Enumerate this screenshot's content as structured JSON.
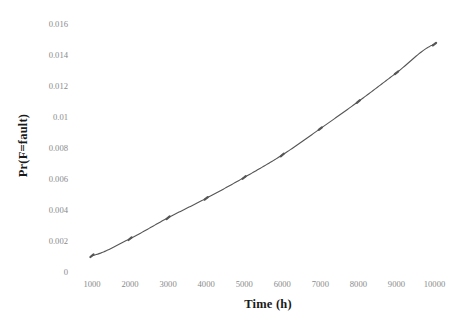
{
  "chart_data": {
    "type": "line",
    "title": "",
    "xlabel": "Time (h)",
    "ylabel": "Pr(F=fault)",
    "xlim": [
      1000,
      10000
    ],
    "ylim": [
      0,
      0.016
    ],
    "grid": false,
    "legend": null,
    "line_color": "#555555",
    "marker": "tick",
    "x": [
      1000,
      2000,
      3000,
      4000,
      5000,
      6000,
      7000,
      8000,
      9000,
      10000
    ],
    "values": [
      0.00105,
      0.00215,
      0.0035,
      0.00475,
      0.0061,
      0.00755,
      0.00925,
      0.011,
      0.01285,
      0.0147
    ],
    "categories": [
      "1000",
      "2000",
      "3000",
      "4000",
      "5000",
      "6000",
      "7000",
      "8000",
      "9000",
      "10000"
    ],
    "xticks": [
      "1000",
      "2000",
      "3000",
      "4000",
      "5000",
      "6000",
      "7000",
      "8000",
      "9000",
      "10000"
    ],
    "yticks": [
      "0",
      "0.002",
      "0.004",
      "0.006",
      "0.008",
      "0.01",
      "0.012",
      "0.014",
      "0.016"
    ],
    "ytick_values": [
      0,
      0.002,
      0.004,
      0.006,
      0.008,
      0.01,
      0.012,
      0.014,
      0.016
    ],
    "series": [
      {
        "name": "Pr(F=fault)",
        "values": [
          0.00105,
          0.00215,
          0.0035,
          0.00475,
          0.0061,
          0.00755,
          0.00925,
          0.011,
          0.01285,
          0.0147
        ]
      }
    ],
    "colors": {
      "line": "#555555",
      "tick_label": "#8a8a8a",
      "axis_title": "#1a1a1a",
      "background": "#ffffff"
    }
  }
}
